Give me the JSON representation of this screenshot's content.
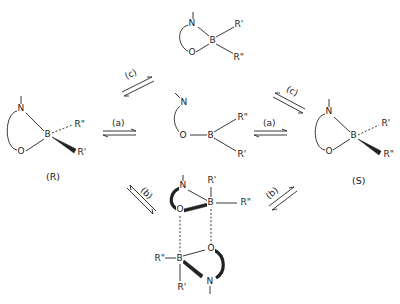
{
  "diagram": {
    "type": "reaction-scheme",
    "structures": {
      "R_isomer": {
        "label": "(R)",
        "atoms": {
          "n": "N",
          "o": "O",
          "b": "B",
          "r_dash": "R\"",
          "r_wedge": "R'"
        }
      },
      "S_isomer": {
        "label": "(S)",
        "atoms": {
          "n": "N",
          "o": "O",
          "b": "B",
          "r_dash": "R'",
          "r_wedge": "R\""
        }
      },
      "open_chain": {
        "atoms": {
          "n": "N",
          "o": "O",
          "b": "B",
          "r_top": "R\"",
          "r_bottom": "R'"
        }
      },
      "planar_chelate": {
        "atoms": {
          "n": "N",
          "o": "O",
          "b": "B",
          "r_top": "R'",
          "r_bottom": "R\""
        }
      },
      "dimer": {
        "upper": {
          "n": "N",
          "o": "O",
          "b": "B",
          "r_top": "R'",
          "r_right": "R\""
        },
        "lower": {
          "n": "N",
          "o": "O",
          "b": "B",
          "r_left": "R\"",
          "r_bottom": "R'"
        }
      }
    },
    "equilibria": [
      {
        "id": "a_left",
        "label": "(a)",
        "between": [
          "(R)",
          "open_chain"
        ]
      },
      {
        "id": "a_right",
        "label": "(a)",
        "between": [
          "open_chain",
          "(S)"
        ]
      },
      {
        "id": "c_left",
        "label": "(c)",
        "between": [
          "(R)",
          "planar_chelate"
        ]
      },
      {
        "id": "c_right",
        "label": "(c)",
        "between": [
          "planar_chelate",
          "(S)"
        ]
      },
      {
        "id": "b_left",
        "label": "(b)",
        "between": [
          "(R)",
          "dimer"
        ]
      },
      {
        "id": "b_right",
        "label": "(b)",
        "between": [
          "dimer",
          "(S)"
        ]
      }
    ]
  }
}
